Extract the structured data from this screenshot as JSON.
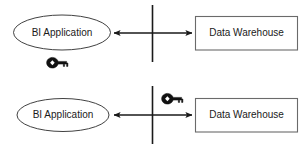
{
  "diagram": {
    "type": "architecture-flow",
    "background_color": "#ffffff",
    "line_color": "#1a1a1a",
    "box_border_color": "#6a6a6a",
    "ellipse_border_color": "#2b2b2b",
    "text_color": "#1a1a1a",
    "panels": [
      {
        "id": "top",
        "name": "client-side-key-scenario",
        "source": {
          "label": "BI Application",
          "shape": "ellipse",
          "icon": "none"
        },
        "target": {
          "label": "Data Warehouse",
          "shape": "rectangle",
          "icon": "none"
        },
        "connector": {
          "direction": "bidirectional",
          "arrowheads": [
            "left",
            "right"
          ]
        },
        "boundary": {
          "orientation": "vertical",
          "label": ""
        },
        "key": {
          "icon": "key-icon",
          "placement": "below-source",
          "label": ""
        }
      },
      {
        "id": "bottom",
        "name": "server-side-key-scenario",
        "source": {
          "label": "BI Application",
          "shape": "ellipse",
          "icon": "none"
        },
        "target": {
          "label": "Data Warehouse",
          "shape": "rectangle",
          "icon": "none"
        },
        "connector": {
          "direction": "bidirectional",
          "arrowheads": [
            "left",
            "right"
          ]
        },
        "boundary": {
          "orientation": "vertical",
          "label": ""
        },
        "key": {
          "icon": "key-icon",
          "placement": "above-target",
          "label": ""
        }
      }
    ]
  }
}
